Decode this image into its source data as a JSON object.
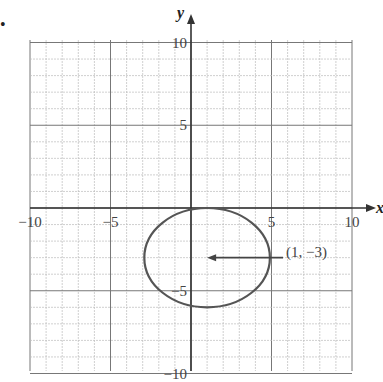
{
  "figure": {
    "bullet": "•",
    "x_axis_label": "x",
    "y_axis_label": "y",
    "x_ticks": [
      {
        "value": -10,
        "label": "−10"
      },
      {
        "value": -5,
        "label": "−5"
      },
      {
        "value": 5,
        "label": "5"
      },
      {
        "value": 10,
        "label": "10"
      }
    ],
    "y_ticks": [
      {
        "value": 10,
        "label": "10"
      },
      {
        "value": 5,
        "label": "5"
      },
      {
        "value": -5,
        "label": "−5"
      },
      {
        "value": -10,
        "label": "−10"
      }
    ],
    "range": {
      "xmin": -10,
      "xmax": 10,
      "ymin": -10,
      "ymax": 10
    },
    "circle": {
      "center": [
        1,
        -3
      ],
      "radius": 3,
      "color": "#555555"
    },
    "annotation": {
      "label": "(1, −3)",
      "points_to": [
        1,
        -3
      ]
    },
    "colors": {
      "grid_minor": "#bbbbbb",
      "grid_major": "#777777",
      "axis": "#333333"
    }
  }
}
